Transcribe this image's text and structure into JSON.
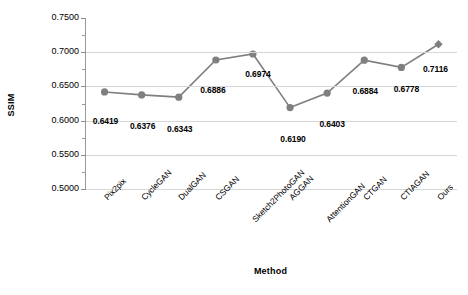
{
  "chart_data": {
    "type": "line",
    "title": "",
    "xlabel": "Method",
    "ylabel": "SSIM",
    "ylim": [
      0.5,
      0.75
    ],
    "ytick_step": 0.05,
    "yminor_step": 0.025,
    "grid": true,
    "legend": false,
    "legend_position": "none",
    "marker_color": "#7f7f7f",
    "line_color": "#7f7f7f",
    "grid_color": "#d7d7d7",
    "axis_color": "#9a9a9a",
    "categories": [
      "Pix2pix",
      "CycleGAN",
      "DualGAN",
      "CSGAN",
      "Sketch2PhotoGAN",
      "AGGAN",
      "AttentionGAN",
      "CTGAN",
      "CTIAGAN",
      "Ours"
    ],
    "values": [
      0.6419,
      0.6376,
      0.6343,
      0.6886,
      0.6974,
      0.619,
      0.6403,
      0.6884,
      0.6778,
      0.7116
    ],
    "value_labels": [
      "0.6419",
      "0.6376",
      "0.6343",
      "0.6886",
      "0.6974",
      "0.6190",
      "0.6403",
      "0.6884",
      "0.6778",
      "0.7116"
    ],
    "markers": [
      "circle",
      "circle",
      "circle",
      "circle",
      "circle",
      "circle",
      "circle",
      "circle",
      "circle",
      "diamond"
    ],
    "ytick_labels": [
      "0.7500",
      "0.7000",
      "0.6500",
      "0.6000",
      "0.5500",
      "0.5000"
    ],
    "ytick_values": [
      0.75,
      0.7,
      0.65,
      0.6,
      0.55,
      0.5
    ]
  }
}
